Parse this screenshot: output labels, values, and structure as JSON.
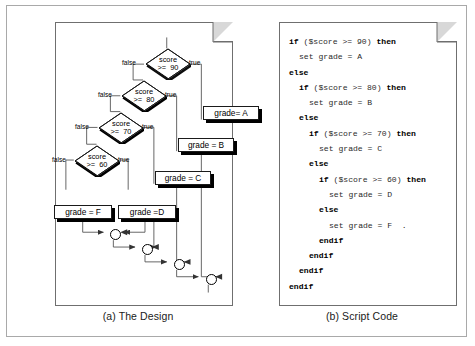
{
  "figure": {
    "caption_a": "(a) The Design",
    "caption_b": "(b) Script Code"
  },
  "design": {
    "decisions": [
      {
        "id": "d90",
        "line1": "score",
        "line2": ">=  90",
        "false_label": "false",
        "true_label": "true"
      },
      {
        "id": "d80",
        "line1": "score",
        "line2": ">=  80",
        "false_label": "false",
        "true_label": "true"
      },
      {
        "id": "d70",
        "line1": "score",
        "line2": ">=  70",
        "false_label": "false",
        "true_label": "true"
      },
      {
        "id": "d60",
        "line1": "score",
        "line2": ">=  60",
        "false_label": "false",
        "true_label": "true"
      }
    ],
    "processes": [
      {
        "id": "gA",
        "label": "grade= A"
      },
      {
        "id": "gB",
        "label": "grade = B"
      },
      {
        "id": "gC",
        "label": "grade = C"
      },
      {
        "id": "gD",
        "label": "grade =D"
      },
      {
        "id": "gF",
        "label": "grade = F"
      }
    ],
    "merge_count": 4
  },
  "code": {
    "lines": [
      {
        "indent": 0,
        "parts": [
          {
            "t": "if",
            "b": true
          },
          {
            "t": " ($score >= 90) ",
            "b": false
          },
          {
            "t": "then",
            "b": true
          }
        ]
      },
      {
        "indent": 1,
        "parts": [
          {
            "t": "set grade = A",
            "b": false
          }
        ]
      },
      {
        "indent": 0,
        "parts": [
          {
            "t": "else",
            "b": true
          }
        ]
      },
      {
        "indent": 1,
        "parts": [
          {
            "t": "if",
            "b": true
          },
          {
            "t": " ($score >= 80) ",
            "b": false
          },
          {
            "t": "then",
            "b": true
          }
        ]
      },
      {
        "indent": 2,
        "parts": [
          {
            "t": "set grade = B",
            "b": false
          }
        ]
      },
      {
        "indent": 1,
        "parts": [
          {
            "t": "else",
            "b": true
          }
        ]
      },
      {
        "indent": 2,
        "parts": [
          {
            "t": "if",
            "b": true
          },
          {
            "t": " ($score >= 70) ",
            "b": false
          },
          {
            "t": "then",
            "b": true
          }
        ]
      },
      {
        "indent": 3,
        "parts": [
          {
            "t": "set grade = C",
            "b": false
          }
        ]
      },
      {
        "indent": 2,
        "parts": [
          {
            "t": "else",
            "b": true
          }
        ]
      },
      {
        "indent": 3,
        "parts": [
          {
            "t": "if",
            "b": true
          },
          {
            "t": " ($score >= 60) ",
            "b": false
          },
          {
            "t": "then",
            "b": true
          }
        ]
      },
      {
        "indent": 4,
        "parts": [
          {
            "t": "set grade = D",
            "b": false
          }
        ]
      },
      {
        "indent": 3,
        "parts": [
          {
            "t": "else",
            "b": true
          }
        ]
      },
      {
        "indent": 4,
        "parts": [
          {
            "t": "set grade = F  .",
            "b": false
          }
        ]
      },
      {
        "indent": 3,
        "parts": [
          {
            "t": "endif",
            "b": true
          }
        ]
      },
      {
        "indent": 2,
        "parts": [
          {
            "t": "endif",
            "b": true
          }
        ]
      },
      {
        "indent": 1,
        "parts": [
          {
            "t": "endif",
            "b": true
          }
        ]
      },
      {
        "indent": 0,
        "parts": [
          {
            "t": "endif",
            "b": true
          }
        ]
      }
    ]
  },
  "colors": {
    "frame_border": "#a9a9a9",
    "panel_border": "#6f6f6f",
    "fold_fill": "#d8d8d8",
    "node_stroke": "#1a1a1a",
    "shadow": "#000000",
    "connector": "#555555",
    "text": "#111111"
  }
}
